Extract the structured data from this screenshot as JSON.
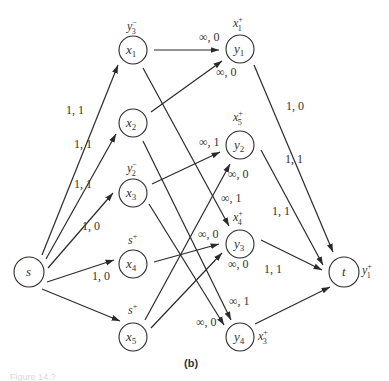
{
  "caption": "(b)",
  "figure_label": "Figure 14.?",
  "nodes": {
    "s": {
      "label": "s",
      "sub": "",
      "dual": "",
      "dual_sub": "",
      "dual_sup": ""
    },
    "x1": {
      "label": "x",
      "sub": "1",
      "dual": "y",
      "dual_sub": "3",
      "dual_sup": "−"
    },
    "x2": {
      "label": "x",
      "sub": "2",
      "dual": "",
      "dual_sub": "",
      "dual_sup": ""
    },
    "x3": {
      "label": "x",
      "sub": "3",
      "dual": "y",
      "dual_sub": "2",
      "dual_sup": "−"
    },
    "x4": {
      "label": "x",
      "sub": "4",
      "dual": "s",
      "dual_sub": "",
      "dual_sup": "+"
    },
    "x5": {
      "label": "x",
      "sub": "5",
      "dual": "s",
      "dual_sub": "",
      "dual_sup": "+"
    },
    "y1": {
      "label": "y",
      "sub": "1",
      "dual": "x",
      "dual_sub": "1",
      "dual_sup": "+"
    },
    "y2": {
      "label": "y",
      "sub": "2",
      "dual": "x",
      "dual_sub": "5",
      "dual_sup": "+"
    },
    "y3": {
      "label": "y",
      "sub": "3",
      "dual": "x",
      "dual_sub": "4",
      "dual_sup": "+"
    },
    "y4": {
      "label": "y",
      "sub": "4",
      "dual": "x",
      "dual_sub": "3",
      "dual_sup": "+"
    },
    "t": {
      "label": "t",
      "sub": "",
      "dual": "y",
      "dual_sub": "1",
      "dual_sup": "+"
    }
  },
  "edges": [
    {
      "from": "s",
      "to": "x1",
      "label": "1, 1"
    },
    {
      "from": "s",
      "to": "x2",
      "label": "1, 1"
    },
    {
      "from": "s",
      "to": "x3",
      "label": "1, 1"
    },
    {
      "from": "s",
      "to": "x4",
      "label": "1, 0"
    },
    {
      "from": "s",
      "to": "x5",
      "label": "1, 0"
    },
    {
      "from": "x1",
      "to": "y1",
      "label": "∞, 0"
    },
    {
      "from": "x2",
      "to": "y1",
      "label": "∞, 0"
    },
    {
      "from": "x3",
      "to": "y2",
      "label": "∞, 1"
    },
    {
      "from": "x5",
      "to": "y2",
      "label": "∞, 0"
    },
    {
      "from": "x1",
      "to": "y3",
      "label": "∞, 1"
    },
    {
      "from": "x4",
      "to": "y3",
      "label": "∞, 0"
    },
    {
      "from": "x5",
      "to": "y3",
      "label": "∞, 0"
    },
    {
      "from": "x2",
      "to": "y4",
      "label": "∞, 1"
    },
    {
      "from": "x3",
      "to": "y4",
      "label": "∞, 0"
    },
    {
      "from": "y1",
      "to": "t",
      "label": "1, 0"
    },
    {
      "from": "y2",
      "to": "t",
      "label": "1, 1"
    },
    {
      "from": "y3",
      "to": "t",
      "label": "1, 1"
    },
    {
      "from": "y4",
      "to": "t",
      "label": "1, 1"
    }
  ]
}
